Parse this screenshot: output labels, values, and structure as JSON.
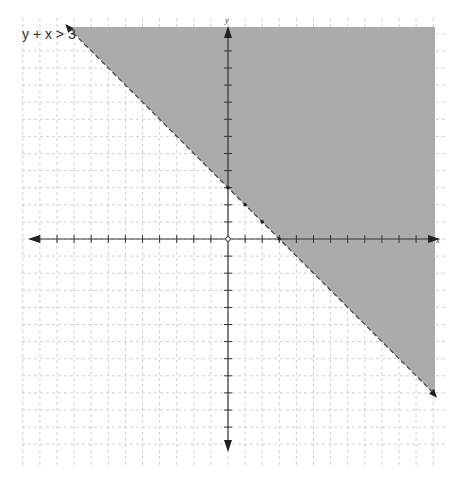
{
  "chart_data": {
    "type": "inequality-graph",
    "title": "y + x > 3",
    "inequality": {
      "lhs": "y + x",
      "operator": ">",
      "rhs": 3
    },
    "boundary_line": {
      "slope": -1,
      "intercept": 3,
      "style": "dashed",
      "points": [
        [
          0,
          3
        ],
        [
          1,
          2
        ],
        [
          2,
          1
        ],
        [
          3,
          0
        ]
      ]
    },
    "shaded_region": "above",
    "xlabel": "x",
    "ylabel": "y",
    "xlim": [
      -12,
      12
    ],
    "ylim": [
      -12,
      13
    ],
    "tick_step": 1,
    "grid": true,
    "origin_marker": "open-circle"
  },
  "labels": {
    "inequality": "y + x > 3",
    "x_axis": "x",
    "y_axis": "y"
  },
  "layout": {
    "origin_px": [
      228,
      239
    ],
    "unit_px": 17.1,
    "shade_color": "#ababab",
    "grid_color": "#d0d0d0",
    "axis_color": "#333333"
  }
}
